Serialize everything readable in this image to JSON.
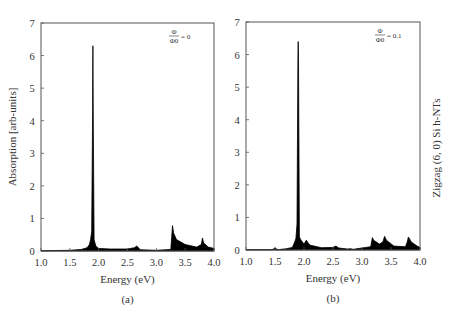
{
  "figure": {
    "side_label": "Zigzag (6, 0) Si h-NTs"
  },
  "chart_data": [
    {
      "type": "area",
      "panel": "(a)",
      "title": "",
      "annotation": {
        "numerator": "Φ",
        "denominator": "Φ0",
        "value": "= 0"
      },
      "xlabel": "Energy (eV)",
      "ylabel": "Absorption [arb-units]",
      "xlim": [
        1.0,
        4.0
      ],
      "ylim": [
        0,
        7
      ],
      "xticks": [
        "1.0",
        "1.5",
        "2.0",
        "2.5",
        "3.0",
        "3.5",
        "4.0"
      ],
      "yticks": [
        "0",
        "1",
        "2",
        "3",
        "4",
        "5",
        "6",
        "7"
      ],
      "grid": false,
      "series": [
        {
          "name": "Φ/Φ0 = 0",
          "color": "#000000",
          "x": [
            1.0,
            1.5,
            1.7,
            1.8,
            1.84,
            1.86,
            1.88,
            1.895,
            1.9,
            1.905,
            1.92,
            1.95,
            2.0,
            2.2,
            2.5,
            2.62,
            2.66,
            2.68,
            2.72,
            3.0,
            3.25,
            3.28,
            3.3,
            3.35,
            3.5,
            3.7,
            3.78,
            3.8,
            3.82,
            3.9,
            4.0
          ],
          "y": [
            0.01,
            0.02,
            0.05,
            0.1,
            0.2,
            0.35,
            0.6,
            4.3,
            6.3,
            4.3,
            0.35,
            0.15,
            0.08,
            0.06,
            0.06,
            0.1,
            0.15,
            0.12,
            0.04,
            0.02,
            0.05,
            0.78,
            0.55,
            0.35,
            0.2,
            0.12,
            0.2,
            0.4,
            0.25,
            0.12,
            0.08
          ]
        }
      ],
      "peaks": [
        {
          "x": 1.9,
          "y": 6.3
        },
        {
          "x": 2.67,
          "y": 0.15
        },
        {
          "x": 3.29,
          "y": 0.78
        },
        {
          "x": 3.8,
          "y": 0.4
        }
      ]
    },
    {
      "type": "area",
      "panel": "(b)",
      "title": "",
      "annotation": {
        "numerator": "Φ",
        "denominator": "Φ0",
        "value": "= 0.1"
      },
      "xlabel": "Energy (eV)",
      "ylabel": "",
      "xlim": [
        1.0,
        4.0
      ],
      "ylim": [
        0,
        7
      ],
      "xticks": [
        "1.0",
        "1.5",
        "2.0",
        "2.5",
        "3.0",
        "3.5",
        "4.0"
      ],
      "yticks": [
        "0",
        "1",
        "2",
        "3",
        "4",
        "5",
        "6",
        "7"
      ],
      "grid": false,
      "series": [
        {
          "name": "Φ/Φ0 = 0.1",
          "color": "#000000",
          "x": [
            1.0,
            1.45,
            1.5,
            1.55,
            1.7,
            1.8,
            1.84,
            1.86,
            1.88,
            1.895,
            1.9,
            1.905,
            1.92,
            1.95,
            2.0,
            2.04,
            2.06,
            2.1,
            2.3,
            2.5,
            2.55,
            2.6,
            2.75,
            2.8,
            2.85,
            3.0,
            3.15,
            3.18,
            3.2,
            3.3,
            3.36,
            3.39,
            3.42,
            3.55,
            3.75,
            3.78,
            3.8,
            3.85,
            3.95,
            4.0
          ],
          "y": [
            0.01,
            0.01,
            0.06,
            0.01,
            0.04,
            0.08,
            0.25,
            0.35,
            0.8,
            5.8,
            6.4,
            5.8,
            0.4,
            0.3,
            0.18,
            0.3,
            0.25,
            0.15,
            0.07,
            0.08,
            0.12,
            0.06,
            0.03,
            0.04,
            0.02,
            0.06,
            0.1,
            0.38,
            0.3,
            0.18,
            0.25,
            0.42,
            0.3,
            0.12,
            0.1,
            0.25,
            0.4,
            0.25,
            0.12,
            0.08
          ]
        }
      ],
      "peaks": [
        {
          "x": 1.9,
          "y": 6.4
        },
        {
          "x": 2.06,
          "y": 0.3
        },
        {
          "x": 2.55,
          "y": 0.12
        },
        {
          "x": 3.19,
          "y": 0.38
        },
        {
          "x": 3.39,
          "y": 0.42
        },
        {
          "x": 3.8,
          "y": 0.4
        }
      ]
    }
  ]
}
